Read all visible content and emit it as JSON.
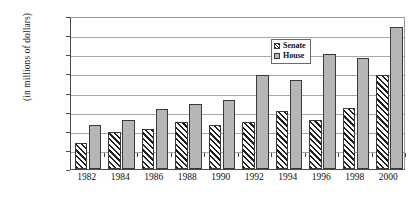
{
  "chart_data": {
    "type": "bar",
    "title": "",
    "xlabel": "",
    "ylabel": "(in millions of dollars)",
    "ylim": [
      0,
      400
    ],
    "ytick_step": 50,
    "grid": true,
    "legend_position": "upper-center-right",
    "categories": [
      "1982",
      "1984",
      "1986",
      "1988",
      "1990",
      "1992",
      "1994",
      "1996",
      "1998",
      "2000"
    ],
    "ytick_labels": [
      "$400",
      "$350",
      "$300",
      "$250",
      "$200",
      "$150",
      "$100",
      "$50",
      "$0"
    ],
    "ytick_values": [
      400,
      350,
      300,
      250,
      200,
      150,
      100,
      50,
      0
    ],
    "series": [
      {
        "name": "Senate",
        "fill": "diagonal-hatch",
        "color": "#ffffff",
        "values": [
          68,
          98,
          105,
          123,
          116,
          124,
          152,
          129,
          160,
          247
        ]
      },
      {
        "name": "House",
        "fill": "solid-gray",
        "color": "#b6b6b6",
        "values": [
          115,
          128,
          156,
          171,
          180,
          245,
          232,
          300,
          291,
          371
        ]
      }
    ]
  },
  "legend": {
    "items": [
      {
        "label": "Senate",
        "swatch": "senate"
      },
      {
        "label": "House",
        "swatch": "house"
      }
    ]
  }
}
